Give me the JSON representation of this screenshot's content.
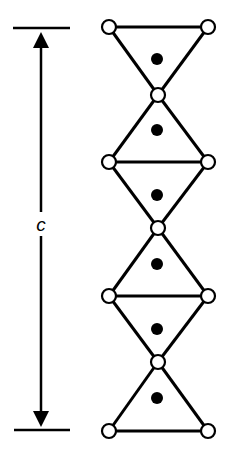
{
  "diagram": {
    "dimension": {
      "label": "c",
      "x": 41,
      "y_top": 28,
      "y_bottom": 430,
      "bar_x1": 13,
      "bar_x2": 70
    },
    "chain": {
      "left_x": 109,
      "right_x": 208,
      "center_x": 158,
      "rows": [
        27,
        95,
        162,
        228,
        296,
        362,
        431
      ],
      "row_types": [
        "edge",
        "apex",
        "edge",
        "apex",
        "edge",
        "apex",
        "edge"
      ],
      "cation_dots_y": [
        59,
        130,
        195,
        264,
        329,
        398
      ],
      "node_radius": 7,
      "dot_radius": 6
    },
    "colors": {
      "line": "#000000",
      "node_fill": "#ffffff",
      "dot": "#000000",
      "background": "#ffffff"
    }
  }
}
